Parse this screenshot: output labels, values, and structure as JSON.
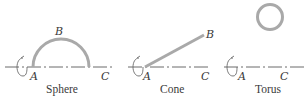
{
  "colors": {
    "shape_stroke": "#a9a9a9",
    "axis_stroke": "#6a6a6a",
    "text": "#3a3a3a",
    "background": "#ffffff"
  },
  "panels": [
    {
      "id": "sphere",
      "caption": "Sphere",
      "points": {
        "A": "A",
        "B": "B",
        "C": "C"
      },
      "generating_curve": "semicircle",
      "rotation_icon": "rotation-arrow-icon"
    },
    {
      "id": "cone",
      "caption": "Cone",
      "points": {
        "A": "A",
        "B": "B",
        "C": "C"
      },
      "generating_curve": "straight line",
      "rotation_icon": "rotation-arrow-icon"
    },
    {
      "id": "torus",
      "caption": "Torus",
      "points": {
        "A": "A",
        "C": "C"
      },
      "generating_curve": "circle",
      "rotation_icon": "rotation-arrow-icon"
    }
  ]
}
